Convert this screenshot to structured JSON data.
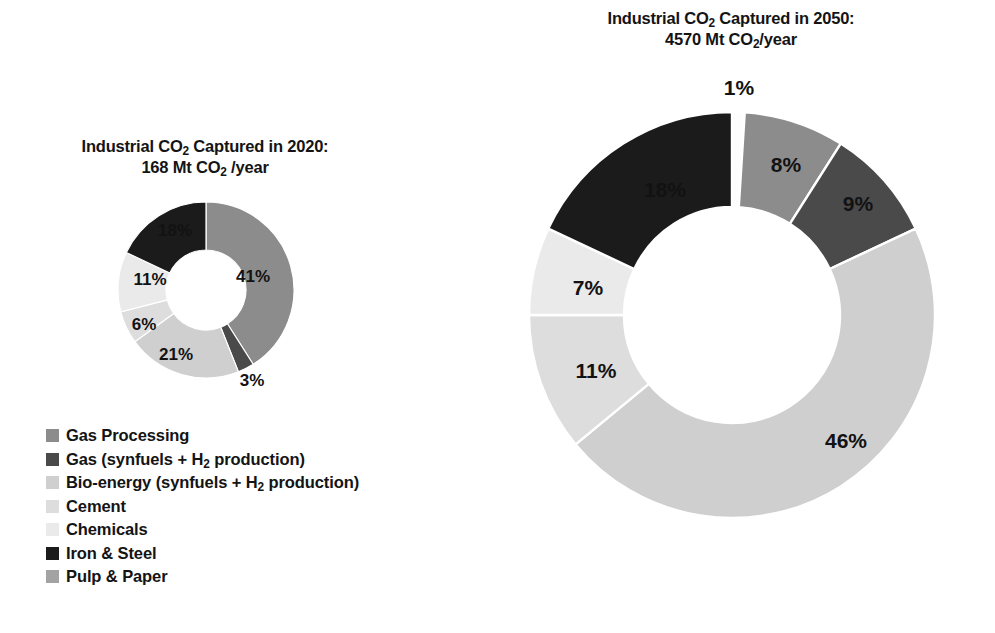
{
  "chart_data": [
    {
      "type": "pie",
      "id": "donut-2020",
      "title_line1": "Industrial CO₂ Captured in 2020:",
      "title_line2": "168 Mt CO₂ /year",
      "year": "2020",
      "total_value": 168,
      "total_units": "Mt CO2/year",
      "donut": true,
      "categories": [
        "Gas Processing",
        "Gas (synfuels + H2 production)",
        "Bio-energy (synfuels + H2 production)",
        "Cement",
        "Chemicals",
        "Iron & Steel",
        "Pulp & Paper"
      ],
      "values": [
        41,
        3,
        21,
        6,
        11,
        18,
        0
      ],
      "value_labels": [
        "41%",
        "3%",
        "21%",
        "6%",
        "11%",
        "18%",
        ""
      ],
      "colors": [
        "#8c8c8c",
        "#4a4a4a",
        "#cfcfcf",
        "#dddddd",
        "#eaeaea",
        "#1b1b1b",
        "#a3a3a3"
      ]
    },
    {
      "type": "pie",
      "id": "donut-2050",
      "title_line1": "Industrial CO₂ Captured in 2050:",
      "title_line2": "4570 Mt CO₂/year",
      "year": "2050",
      "total_value": 4570,
      "total_units": "Mt CO2/year",
      "donut": true,
      "categories": [
        "Gas Processing",
        "Gas (synfuels + H2 production)",
        "Bio-energy (synfuels + H2 production)",
        "Cement",
        "Chemicals",
        "Iron & Steel",
        "Pulp & Paper"
      ],
      "values": [
        8,
        9,
        46,
        11,
        7,
        18,
        1
      ],
      "value_labels": [
        "8%",
        "9%",
        "46%",
        "11%",
        "7%",
        "18%",
        "1%"
      ],
      "colors": [
        "#8c8c8c",
        "#4a4a4a",
        "#cfcfcf",
        "#dddddd",
        "#eaeaea",
        "#1b1b1b",
        "#fdfdfd"
      ]
    }
  ],
  "titles": {
    "t2020": {
      "prefix": "Industrial CO",
      "sub": "2",
      "suffix": " Captured in 2020:",
      "line2_prefix": "168 Mt CO",
      "line2_sub": "2",
      "line2_suffix": " /year"
    },
    "t2050": {
      "prefix": "Industrial CO",
      "sub": "2",
      "suffix": " Captured in 2050:",
      "line2_prefix": "4570 Mt CO",
      "line2_sub": "2",
      "line2_suffix": "/year"
    }
  },
  "legend": {
    "position": "bottom-left",
    "items": [
      {
        "label": "Gas Processing",
        "color": "#8c8c8c",
        "has_sub": false
      },
      {
        "label": "Gas (synfuels + H2 production)",
        "color": "#4a4a4a",
        "has_sub": true,
        "pre": "Gas (synfuels + H",
        "sub": "2",
        "post": " production)"
      },
      {
        "label": "Bio-energy (synfuels + H2 production)",
        "color": "#cfcfcf",
        "has_sub": true,
        "pre": "Bio-energy (synfuels + H",
        "sub": "2",
        "post": " production)"
      },
      {
        "label": "Cement",
        "color": "#dddddd",
        "has_sub": false
      },
      {
        "label": "Chemicals",
        "color": "#eaeaea",
        "has_sub": false
      },
      {
        "label": "Iron & Steel",
        "color": "#1b1b1b",
        "has_sub": false
      },
      {
        "label": "Pulp & Paper",
        "color": "#a3a3a3",
        "has_sub": false
      }
    ]
  },
  "labels_2020": [
    {
      "text": "41%",
      "x": 253,
      "y": 277
    },
    {
      "text": "3%",
      "x": 252,
      "y": 381
    },
    {
      "text": "21%",
      "x": 176,
      "y": 355
    },
    {
      "text": "6%",
      "x": 144,
      "y": 325
    },
    {
      "text": "11%",
      "x": 150,
      "y": 280
    },
    {
      "text": "18%",
      "x": 175,
      "y": 231
    }
  ],
  "labels_2050": [
    {
      "text": "1%",
      "x": 739,
      "y": 88
    },
    {
      "text": "8%",
      "x": 786,
      "y": 165
    },
    {
      "text": "9%",
      "x": 858,
      "y": 204
    },
    {
      "text": "46%",
      "x": 846,
      "y": 441
    },
    {
      "text": "11%",
      "x": 596,
      "y": 371
    },
    {
      "text": "7%",
      "x": 588,
      "y": 288
    },
    {
      "text": "18%",
      "x": 665,
      "y": 190
    }
  ]
}
